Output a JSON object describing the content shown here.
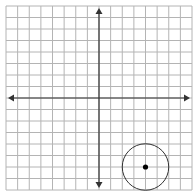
{
  "grid": {
    "columns": 16,
    "rows": 16,
    "x_min": -8,
    "x_max": 8,
    "y_min": -8,
    "y_max": 8,
    "line_color": "#b4b4b4",
    "axis_color": "#333333"
  },
  "circle": {
    "center_x": 4,
    "center_y": -6,
    "radius": 2,
    "stroke_color": "#333333"
  },
  "center_point": {
    "x": 4,
    "y": -6,
    "color": "#000000"
  }
}
